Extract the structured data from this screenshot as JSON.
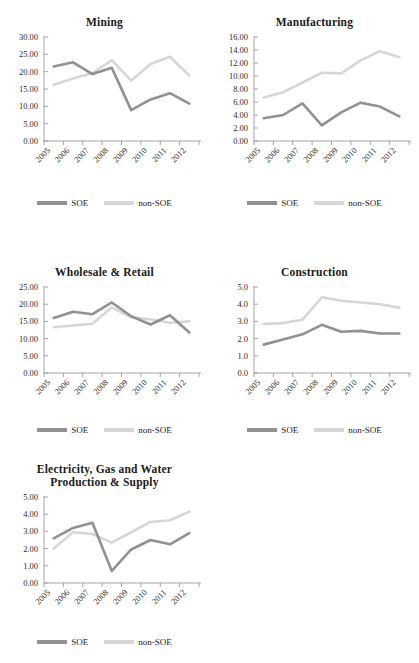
{
  "figure": {
    "background": "#ffffff",
    "series_colors": {
      "soe": "#919191",
      "non_soe": "#d6d6d6"
    },
    "legend": {
      "soe_label": "SOE",
      "non_soe_label": "non-SOE"
    },
    "footer_note": ""
  },
  "chart_data": [
    {
      "type": "line",
      "title": "Mining",
      "xlabel": "",
      "ylabel": "",
      "x": [
        "2005",
        "2006",
        "2007",
        "2008",
        "2009",
        "2010",
        "2011",
        "2012"
      ],
      "categories": [
        "2005",
        "2006",
        "2007",
        "2008",
        "2009",
        "2010",
        "2011",
        "2012"
      ],
      "ylim": [
        0.0,
        30.0
      ],
      "ytick_values": [
        0.0,
        5.0,
        10.0,
        15.0,
        20.0,
        25.0,
        30.0
      ],
      "ytick_labels": [
        "0.00",
        "5.00",
        "10.00",
        "15.00",
        "20.00",
        "25.00",
        "30.00"
      ],
      "grid": false,
      "legend_position": "bottom",
      "series": [
        {
          "name": "SOE",
          "values": [
            21.5,
            22.7,
            19.3,
            21.1,
            8.9,
            12.0,
            13.8,
            10.8
          ]
        },
        {
          "name": "non-SOE",
          "values": [
            16.2,
            18.0,
            19.6,
            23.3,
            17.4,
            22.2,
            24.3,
            18.9
          ]
        }
      ]
    },
    {
      "type": "line",
      "title": "Manufacturing",
      "xlabel": "",
      "ylabel": "",
      "x": [
        "2005",
        "2006",
        "2007",
        "2008",
        "2009",
        "2010",
        "2011",
        "2012"
      ],
      "categories": [
        "2005",
        "2006",
        "2007",
        "2008",
        "2009",
        "2010",
        "2011",
        "2012"
      ],
      "ylim": [
        0.0,
        16.0
      ],
      "ytick_values": [
        0.0,
        2.0,
        4.0,
        6.0,
        8.0,
        10.0,
        12.0,
        14.0,
        16.0
      ],
      "ytick_labels": [
        "0.00",
        "2.00",
        "4.00",
        "6.00",
        "8.00",
        "10.00",
        "12.00",
        "14.00",
        "16.00"
      ],
      "grid": false,
      "legend_position": "bottom",
      "series": [
        {
          "name": "SOE",
          "values": [
            3.5,
            4.0,
            5.8,
            2.4,
            4.4,
            5.9,
            5.3,
            3.8
          ]
        },
        {
          "name": "non-SOE",
          "values": [
            6.7,
            7.5,
            9.0,
            10.5,
            10.4,
            12.4,
            13.8,
            12.9
          ]
        }
      ]
    },
    {
      "type": "line",
      "title": "Wholesale & Retail",
      "xlabel": "",
      "ylabel": "",
      "x": [
        "2005",
        "2006",
        "2007",
        "2008",
        "2009",
        "2010",
        "2011",
        "2012"
      ],
      "categories": [
        "2005",
        "2006",
        "2007",
        "2008",
        "2009",
        "2010",
        "2011",
        "2012"
      ],
      "ylim": [
        0.0,
        25.0
      ],
      "ytick_values": [
        0.0,
        5.0,
        10.0,
        15.0,
        20.0,
        25.0
      ],
      "ytick_labels": [
        "0.00",
        "5.00",
        "10.00",
        "15.00",
        "20.00",
        "25.00"
      ],
      "grid": false,
      "legend_position": "bottom",
      "series": [
        {
          "name": "SOE",
          "values": [
            16.0,
            17.8,
            17.1,
            20.5,
            16.5,
            14.1,
            16.8,
            11.8
          ]
        },
        {
          "name": "non-SOE",
          "values": [
            13.3,
            13.8,
            14.3,
            19.1,
            16.2,
            15.6,
            14.6,
            15.0
          ]
        }
      ]
    },
    {
      "type": "line",
      "title": "Construction",
      "xlabel": "",
      "ylabel": "",
      "x": [
        "2005",
        "2006",
        "2007",
        "2008",
        "2009",
        "2010",
        "2011",
        "2012"
      ],
      "categories": [
        "2005",
        "2006",
        "2007",
        "2008",
        "2009",
        "2010",
        "2011",
        "2012"
      ],
      "ylim": [
        0.0,
        5.0
      ],
      "ytick_values": [
        0.0,
        1.0,
        2.0,
        3.0,
        4.0,
        5.0
      ],
      "ytick_labels": [
        "0.0",
        "1.0",
        "2.0",
        "3.0",
        "4.0",
        "5.0"
      ],
      "grid": false,
      "legend_position": "bottom",
      "series": [
        {
          "name": "SOE",
          "values": [
            1.65,
            1.95,
            2.25,
            2.8,
            2.4,
            2.45,
            2.3,
            2.3
          ]
        },
        {
          "name": "non-SOE",
          "values": [
            2.85,
            2.9,
            3.1,
            4.4,
            4.2,
            4.1,
            4.0,
            3.8
          ]
        }
      ]
    },
    {
      "type": "line",
      "title_line1": "Electricity, Gas and Water",
      "title_line2": "Production & Supply",
      "title": "Electricity, Gas and Water Production & Supply",
      "xlabel": "",
      "ylabel": "",
      "x": [
        "2005",
        "2006",
        "2007",
        "2008",
        "2009",
        "2010",
        "2011",
        "2012"
      ],
      "categories": [
        "2005",
        "2006",
        "2007",
        "2008",
        "2009",
        "2010",
        "2011",
        "2012"
      ],
      "ylim": [
        0.0,
        5.0
      ],
      "ytick_values": [
        0.0,
        1.0,
        2.0,
        3.0,
        4.0,
        5.0
      ],
      "ytick_labels": [
        "0.00",
        "1.00",
        "2.00",
        "3.00",
        "4.00",
        "5.00"
      ],
      "grid": false,
      "legend_position": "bottom",
      "series": [
        {
          "name": "SOE",
          "values": [
            2.6,
            3.2,
            3.5,
            0.7,
            1.95,
            2.5,
            2.25,
            2.9
          ]
        },
        {
          "name": "non-SOE",
          "values": [
            2.0,
            2.95,
            2.85,
            2.35,
            2.95,
            3.55,
            3.65,
            4.15
          ]
        }
      ]
    }
  ]
}
